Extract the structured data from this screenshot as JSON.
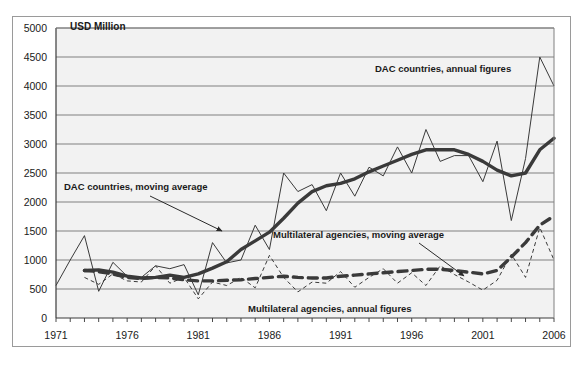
{
  "figure": {
    "axis_unit_label": "USD Million",
    "ghost_top_text": "",
    "frame_color": "#9a9a9a",
    "plot_bg_color": "#f2f2f2",
    "gridline_color": "#808080",
    "series_color": "#3a3a3a"
  },
  "annotations": {
    "dac_annual": "DAC countries, annual figures",
    "dac_moving": "DAC countries, moving average",
    "multi_moving": "Multilateral agencies, moving average",
    "multi_annual": "Multilateral agencies, annual figures"
  },
  "chart_data": {
    "type": "line",
    "title": "",
    "subtitle": "",
    "xlabel": "",
    "ylabel": "USD Million",
    "ylim": [
      0,
      5000
    ],
    "ytick_step": 500,
    "xlim": [
      1971,
      2006
    ],
    "xtick_step": 1,
    "xtick_label_step": 5,
    "grid": true,
    "legend_position": "inline-annotations",
    "ytick_labels": [
      "0",
      "500",
      "1000",
      "1500",
      "2000",
      "2500",
      "3000",
      "3500",
      "4000",
      "4500",
      "5000"
    ],
    "xtick_labels": [
      "1971",
      "1976",
      "1981",
      "1986",
      "1991",
      "1996",
      "2001",
      "2006"
    ],
    "x": [
      1971,
      1972,
      1973,
      1974,
      1975,
      1976,
      1977,
      1978,
      1979,
      1980,
      1981,
      1982,
      1983,
      1984,
      1985,
      1986,
      1987,
      1988,
      1989,
      1990,
      1991,
      1992,
      1993,
      1994,
      1995,
      1996,
      1997,
      1998,
      1999,
      2000,
      2001,
      2002,
      2003,
      2004,
      2005,
      2006
    ],
    "series": [
      {
        "name": "DAC countries, annual figures",
        "style": "thin-solid",
        "values": [
          560,
          1000,
          1420,
          460,
          960,
          720,
          700,
          900,
          850,
          920,
          400,
          1300,
          950,
          1000,
          1600,
          1180,
          2500,
          2180,
          2300,
          1850,
          2500,
          2100,
          2600,
          2450,
          2950,
          2500,
          3250,
          2700,
          2800,
          2800,
          2350,
          3050,
          1680,
          2750,
          4500,
          4000
        ]
      },
      {
        "name": "DAC countries, moving average",
        "style": "thick-solid",
        "values": [
          null,
          null,
          820,
          830,
          790,
          720,
          690,
          700,
          740,
          700,
          760,
          860,
          970,
          1180,
          1330,
          1480,
          1720,
          1980,
          2180,
          2280,
          2320,
          2400,
          2520,
          2620,
          2720,
          2820,
          2900,
          2900,
          2900,
          2820,
          2700,
          2550,
          2450,
          2500,
          2900,
          3100
        ]
      },
      {
        "name": "Multilateral agencies, annual figures",
        "style": "thin-dashed",
        "values": [
          null,
          null,
          700,
          580,
          760,
          640,
          620,
          900,
          600,
          700,
          330,
          620,
          560,
          700,
          520,
          1080,
          700,
          450,
          620,
          600,
          800,
          530,
          700,
          850,
          600,
          780,
          560,
          900,
          750,
          620,
          480,
          650,
          1100,
          700,
          1560,
          1000
        ]
      },
      {
        "name": "Multilateral agencies, moving average",
        "style": "thick-dashed",
        "values": [
          null,
          null,
          820,
          800,
          760,
          700,
          680,
          700,
          690,
          660,
          640,
          640,
          650,
          660,
          680,
          700,
          720,
          700,
          690,
          690,
          720,
          740,
          760,
          780,
          800,
          820,
          840,
          840,
          820,
          790,
          760,
          820,
          1050,
          1300,
          1600,
          1760
        ]
      }
    ],
    "notes": {
      "peak_year": 2005,
      "peak_value": 4500,
      "trough_2001_value": 1680,
      "final_dac_value": 4000,
      "final_multilateral_value": 1000
    }
  }
}
